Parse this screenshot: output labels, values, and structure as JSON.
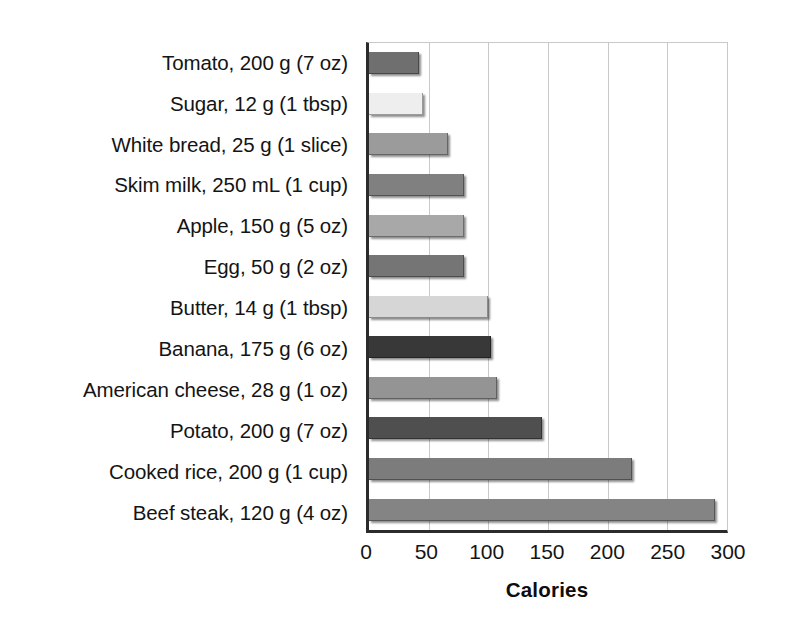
{
  "chart_data": {
    "type": "bar",
    "orientation": "horizontal",
    "title": "",
    "xlabel": "Calories",
    "ylabel": "",
    "xlim": [
      0,
      300
    ],
    "xticks": [
      0,
      50,
      100,
      150,
      200,
      250,
      300
    ],
    "grid": true,
    "legend": false,
    "categories": [
      "Tomato, 200 g (7 oz)",
      "Sugar, 12 g (1 tbsp)",
      "White bread, 25 g (1 slice)",
      "Skim milk, 250 mL (1 cup)",
      "Apple, 150 g (5 oz)",
      "Egg, 50 g (2 oz)",
      "Butter, 14 g (1 tbsp)",
      "Banana, 175 g (6 oz)",
      "American cheese, 28 g (1 oz)",
      "Potato, 200 g (7 oz)",
      "Cooked rice, 200 g (1 cup)",
      "Beef steak, 120 g (4 oz)"
    ],
    "values": [
      42,
      45,
      66,
      80,
      80,
      80,
      100,
      102,
      107,
      145,
      220,
      290
    ],
    "bar_colors": [
      "#6f6f6f",
      "#eeeeee",
      "#9b9b9b",
      "#808080",
      "#a8a8a8",
      "#757575",
      "#d6d6d6",
      "#383838",
      "#949494",
      "#4f4f4f",
      "#7c7c7c",
      "#848484"
    ]
  },
  "axis": {
    "tick_labels": [
      "0",
      "50",
      "100",
      "150",
      "200",
      "250",
      "300"
    ],
    "title": "Calories"
  },
  "colors": {
    "axis_line": "#2b2b2b",
    "gridline": "#c9c9c9",
    "text": "#141414",
    "background": "#ffffff"
  }
}
